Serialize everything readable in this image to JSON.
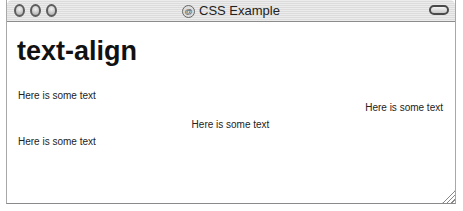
{
  "window": {
    "title": "CSS Example",
    "proxy_icon": "@",
    "controls": [
      "close-button",
      "minimize-button",
      "zoom-button"
    ]
  },
  "content": {
    "heading": "text-align",
    "paragraphs": [
      {
        "text": "Here is some text",
        "align": "left"
      },
      {
        "text": "Here is some text",
        "align": "right"
      },
      {
        "text": "Here is some text",
        "align": "center"
      },
      {
        "text": "Here is some text",
        "align": "left"
      }
    ]
  }
}
